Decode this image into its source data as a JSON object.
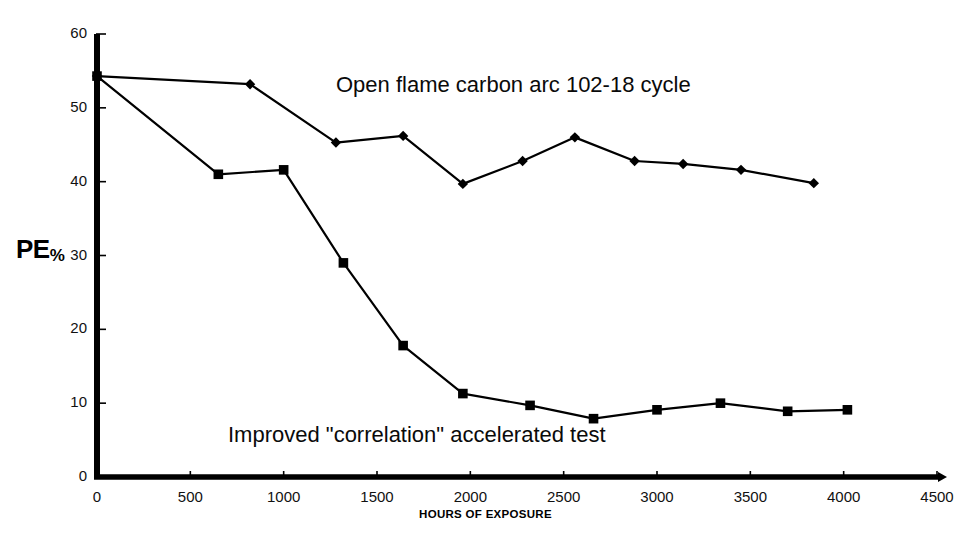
{
  "chart_data": {
    "type": "line",
    "title": "",
    "xlabel": "HOURS OF EXPOSURE",
    "ylabel": "PE%",
    "ylabel_main": "PE",
    "ylabel_sub": "%",
    "xlim": [
      0,
      4500
    ],
    "ylim": [
      0,
      60
    ],
    "xticks": [
      0,
      500,
      1000,
      1500,
      2000,
      2500,
      3000,
      3500,
      4000,
      4500
    ],
    "yticks": [
      0,
      10,
      20,
      30,
      40,
      50,
      60
    ],
    "grid": false,
    "legend_position": "annotations-inline",
    "series": [
      {
        "name": "Open flame carbon arc 102-18 cycle",
        "marker": "diamond",
        "color": "#000000",
        "annotation": "Open flame carbon arc 102-18 cycle",
        "x": [
          0,
          820,
          1280,
          1640,
          1960,
          2280,
          2560,
          2880,
          3140,
          3450,
          3840
        ],
        "y": [
          54.3,
          53.2,
          45.3,
          46.2,
          39.7,
          42.8,
          46.0,
          42.8,
          42.4,
          41.6,
          39.8
        ]
      },
      {
        "name": "Improved \"correlation\" accelerated test",
        "marker": "square",
        "color": "#000000",
        "annotation": "Improved \"correlation\" accelerated test",
        "x": [
          0,
          650,
          1000,
          1320,
          1640,
          1960,
          2320,
          2660,
          3000,
          3340,
          3700,
          4020
        ],
        "y": [
          54.3,
          41.0,
          41.6,
          29.0,
          17.8,
          11.3,
          9.7,
          7.9,
          9.1,
          10.0,
          8.9,
          9.1
        ]
      }
    ]
  },
  "axis": {
    "x_title": "HOURS OF EXPOSURE",
    "y_title_main": "PE",
    "y_title_sub": "%"
  }
}
